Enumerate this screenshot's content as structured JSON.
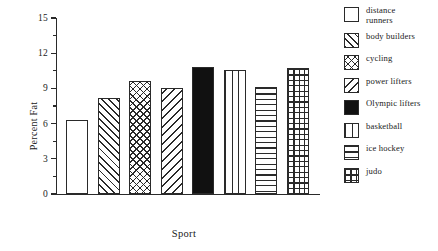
{
  "chart_data": {
    "type": "bar",
    "title": "",
    "xlabel": "Sport",
    "ylabel": "Percent Fat",
    "categories": [
      "distance runners",
      "body builders",
      "cycling",
      "power lifters",
      "Olympic lifters",
      "basketball",
      "ice hockey",
      "judo"
    ],
    "values": [
      6.3,
      8.2,
      9.6,
      9.05,
      10.8,
      10.6,
      9.1,
      10.7
    ],
    "ylim": [
      0,
      15
    ],
    "yticks": [
      0,
      3,
      6,
      9,
      12,
      15
    ],
    "ytick_labels": [
      "0",
      "3",
      "6",
      "9",
      "12",
      "15"
    ],
    "minor_ticks": [
      1.5,
      4.5,
      7.5,
      10.5,
      13.5
    ],
    "xticks": [],
    "xtick_labels": [],
    "grid": false,
    "legend_position": "right",
    "series": [
      {
        "name": "Percent Fat",
        "values": [
          6.3,
          8.2,
          9.6,
          9.05,
          10.8,
          10.6,
          9.1,
          10.7
        ]
      }
    ],
    "fills": [
      "blank",
      "diagonal-up-hatch",
      "cross-hatch",
      "diagonal-down-hatch",
      "solid-black",
      "vertical-lines",
      "horizontal-lines",
      "grid-hatch"
    ],
    "colors": {
      "ink": "#2a2a2a",
      "background": "#ffffff",
      "solid_bar": "#111111"
    }
  },
  "legend": {
    "items": [
      {
        "label": "distance\nrunners",
        "swatch": "blank"
      },
      {
        "label": "body builders",
        "swatch": "diagonal-up-hatch"
      },
      {
        "label": "cycling",
        "swatch": "cross-hatch"
      },
      {
        "label": "power lifters",
        "swatch": "diagonal-down-hatch"
      },
      {
        "label": "Olympic lifters",
        "swatch": "solid-black"
      },
      {
        "label": "basketball",
        "swatch": "vertical-lines"
      },
      {
        "label": "ice hockey",
        "swatch": "horizontal-lines"
      },
      {
        "label": "judo",
        "swatch": "grid-hatch"
      }
    ]
  }
}
